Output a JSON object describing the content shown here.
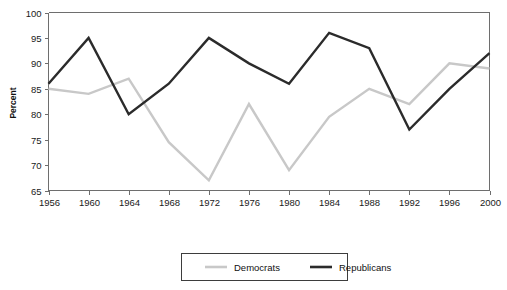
{
  "chart_data": {
    "type": "line",
    "title": "",
    "subtitle": "",
    "xlabel": "",
    "ylabel": "Percent",
    "x": [
      1956,
      1960,
      1964,
      1968,
      1972,
      1976,
      1980,
      1984,
      1988,
      1992,
      1996,
      2000
    ],
    "categories": [
      "1956",
      "1960",
      "1964",
      "1968",
      "1972",
      "1976",
      "1980",
      "1984",
      "1988",
      "1992",
      "1996",
      "2000"
    ],
    "xlim": [
      1956,
      2000
    ],
    "ylim": [
      65,
      100
    ],
    "yticks": [
      65,
      70,
      75,
      80,
      85,
      90,
      95,
      100
    ],
    "ytick_labels": [
      "65",
      "70",
      "75",
      "80",
      "85",
      "90",
      "95",
      "100"
    ],
    "xticks": [
      1956,
      1960,
      1964,
      1968,
      1972,
      1976,
      1980,
      1984,
      1988,
      1992,
      1996,
      2000
    ],
    "grid": false,
    "legend_position": "bottom-center",
    "series": [
      {
        "name": "Democrats",
        "color": "#c8c8c8",
        "values": [
          85,
          84,
          87,
          74.5,
          67,
          82,
          69,
          79.5,
          85,
          82,
          90,
          89
        ]
      },
      {
        "name": "Republicans",
        "color": "#2b2b2b",
        "values": [
          86,
          95,
          80,
          86,
          95,
          90,
          86,
          96,
          93,
          77,
          85,
          92
        ]
      }
    ]
  },
  "axes": {
    "y_title": "Percent"
  },
  "legend": {
    "entries": [
      {
        "label": "Democrats",
        "color": "#c8c8c8"
      },
      {
        "label": "Republicans",
        "color": "#2b2b2b"
      }
    ]
  },
  "colors": {
    "democrats": "#c8c8c8",
    "republicans": "#2b2b2b",
    "axis": "#6e6e6e",
    "text": "#111111",
    "legend_border": "#3d3d3d",
    "background": "#ffffff"
  }
}
